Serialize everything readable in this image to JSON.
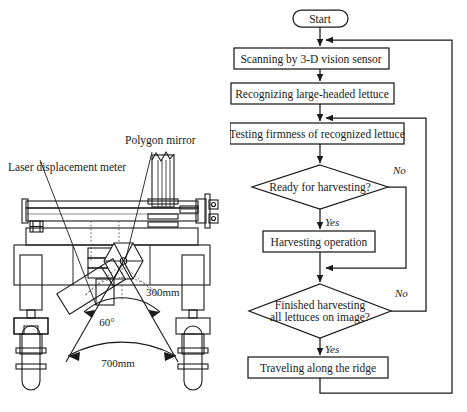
{
  "figure": {
    "panels": [
      {
        "id": "machine-diagram",
        "name": "lettuce-harvester-front-view",
        "labels": [
          {
            "key": "polygon_mirror",
            "text": "Polygon mirror"
          },
          {
            "key": "laser_meter",
            "text": "Laser displacement meter"
          },
          {
            "key": "dim_300",
            "text": "300mm"
          },
          {
            "key": "dim_angle",
            "text": "60°"
          },
          {
            "key": "dim_700",
            "text": "700mm"
          }
        ]
      },
      {
        "id": "flowchart",
        "name": "harvesting-control-flowchart",
        "nodes": [
          {
            "key": "start",
            "shape": "terminator",
            "text": "Start"
          },
          {
            "key": "scan",
            "shape": "process",
            "text": "Scanning by 3-D vision sensor"
          },
          {
            "key": "recognize",
            "shape": "process",
            "text": "Recognizing large-headed lettuce"
          },
          {
            "key": "testing",
            "shape": "process",
            "text": "Testing firmness of recognized lettuce"
          },
          {
            "key": "ready",
            "shape": "decision",
            "text": "Ready for harvesting?"
          },
          {
            "key": "harvest",
            "shape": "process",
            "text": "Harvesting operation"
          },
          {
            "key": "finished",
            "shape": "decision",
            "text_line1": "Finished harvesting",
            "text_line2": "all lettuces on image?"
          },
          {
            "key": "traveling",
            "shape": "process",
            "text": "Traveling along the ridge"
          }
        ],
        "edge_labels": [
          {
            "key": "ready_no",
            "text": "No"
          },
          {
            "key": "ready_yes",
            "text": "Yes"
          },
          {
            "key": "finished_no",
            "text": "No"
          },
          {
            "key": "finished_yes",
            "text": "Yes"
          }
        ]
      }
    ],
    "colors": {
      "stroke": "#1a1a1a",
      "fill": "#ffffff",
      "shade": "#8a8a8a",
      "background": "#ffffff"
    }
  }
}
